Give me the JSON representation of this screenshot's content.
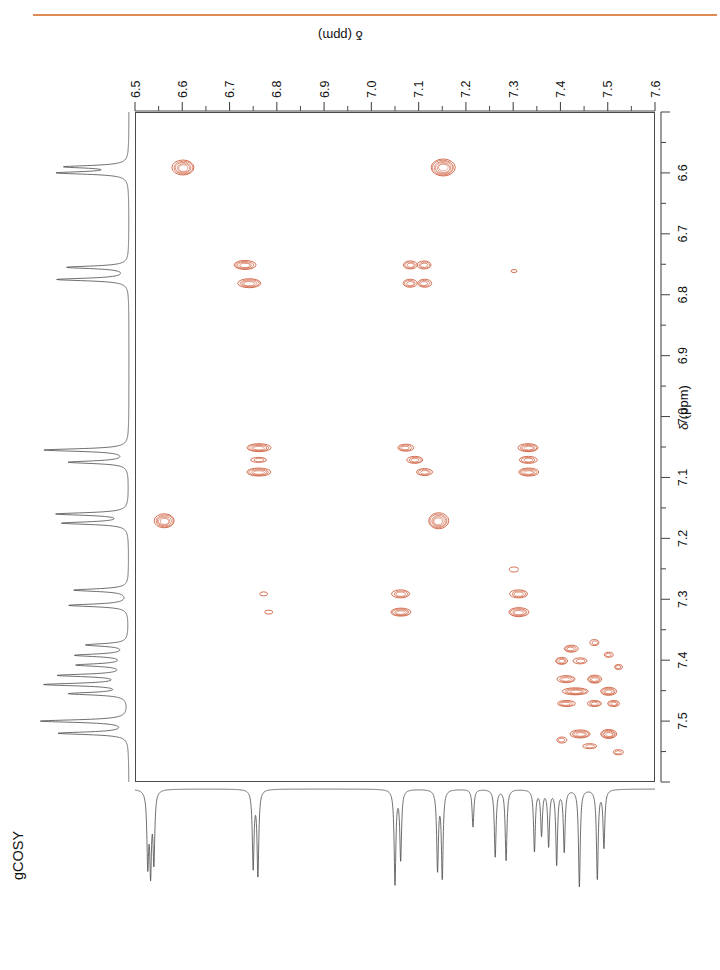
{
  "experiment": {
    "label": "gCOSY",
    "accent_color": "#E08B54",
    "contour_color": "#D2694A",
    "trace_color": "#4a4a4a"
  },
  "axes": {
    "top": {
      "title": "δ (ppm)",
      "ticks": [
        "6.5",
        "6.6",
        "6.7",
        "6.8",
        "6.9",
        "7.0",
        "7.1",
        "7.2",
        "7.3",
        "7.4",
        "7.5",
        "7.6"
      ],
      "min": 6.5,
      "max": 7.6,
      "direction": "left-to-right"
    },
    "right": {
      "title": "δ (ppm)",
      "ticks": [
        "6.6",
        "6.7",
        "6.8",
        "6.9",
        "7.0",
        "7.1",
        "7.2",
        "7.3",
        "7.4",
        "7.5"
      ],
      "min": 6.5,
      "max": 7.6,
      "direction": "top-to-bottom"
    }
  },
  "chart_data": {
    "type": "scatter",
    "title": "gCOSY",
    "xlabel": "δ (ppm)",
    "ylabel": "δ (ppm)",
    "xlim": [
      6.5,
      7.6
    ],
    "ylim": [
      7.6,
      6.5
    ],
    "grid": false,
    "legend": "none",
    "cross_peaks": [
      {
        "x": 6.6,
        "y": 6.59,
        "w": 22,
        "h": 15,
        "levels": 5,
        "note": "diagonal"
      },
      {
        "x": 7.15,
        "y": 6.59,
        "w": 24,
        "h": 17,
        "levels": 6,
        "note": "cross"
      },
      {
        "x": 6.73,
        "y": 6.75,
        "w": 22,
        "h": 9,
        "levels": 4
      },
      {
        "x": 6.74,
        "y": 6.78,
        "w": 23,
        "h": 9,
        "levels": 4
      },
      {
        "x": 7.08,
        "y": 6.75,
        "w": 14,
        "h": 8,
        "levels": 3
      },
      {
        "x": 7.11,
        "y": 6.75,
        "w": 14,
        "h": 8,
        "levels": 3
      },
      {
        "x": 7.08,
        "y": 6.78,
        "w": 14,
        "h": 8,
        "levels": 3
      },
      {
        "x": 7.11,
        "y": 6.78,
        "w": 14,
        "h": 8,
        "levels": 3
      },
      {
        "x": 7.3,
        "y": 6.76,
        "w": 6,
        "h": 3,
        "levels": 1
      },
      {
        "x": 6.76,
        "y": 7.05,
        "w": 24,
        "h": 8,
        "levels": 4
      },
      {
        "x": 6.76,
        "y": 7.07,
        "w": 16,
        "h": 5,
        "levels": 2
      },
      {
        "x": 6.76,
        "y": 7.09,
        "w": 24,
        "h": 8,
        "levels": 4
      },
      {
        "x": 7.07,
        "y": 7.05,
        "w": 16,
        "h": 7,
        "levels": 3
      },
      {
        "x": 7.09,
        "y": 7.07,
        "w": 16,
        "h": 7,
        "levels": 3
      },
      {
        "x": 7.11,
        "y": 7.09,
        "w": 16,
        "h": 7,
        "levels": 3
      },
      {
        "x": 7.33,
        "y": 7.05,
        "w": 20,
        "h": 8,
        "levels": 4
      },
      {
        "x": 7.33,
        "y": 7.07,
        "w": 18,
        "h": 7,
        "levels": 3
      },
      {
        "x": 7.33,
        "y": 7.09,
        "w": 20,
        "h": 8,
        "levels": 4
      },
      {
        "x": 6.56,
        "y": 7.17,
        "w": 20,
        "h": 14,
        "levels": 5,
        "note": "diagonal"
      },
      {
        "x": 7.14,
        "y": 7.17,
        "w": 20,
        "h": 16,
        "levels": 5
      },
      {
        "x": 7.3,
        "y": 7.25,
        "w": 9,
        "h": 5,
        "levels": 1
      },
      {
        "x": 6.77,
        "y": 7.29,
        "w": 8,
        "h": 4,
        "levels": 1
      },
      {
        "x": 6.78,
        "y": 7.32,
        "w": 8,
        "h": 4,
        "levels": 1
      },
      {
        "x": 7.06,
        "y": 7.29,
        "w": 18,
        "h": 8,
        "levels": 3
      },
      {
        "x": 7.06,
        "y": 7.32,
        "w": 20,
        "h": 8,
        "levels": 4
      },
      {
        "x": 7.31,
        "y": 7.29,
        "w": 18,
        "h": 8,
        "levels": 3
      },
      {
        "x": 7.31,
        "y": 7.32,
        "w": 20,
        "h": 9,
        "levels": 4
      },
      {
        "x": 7.42,
        "y": 7.38,
        "w": 14,
        "h": 7,
        "levels": 3
      },
      {
        "x": 7.47,
        "y": 7.37,
        "w": 9,
        "h": 6,
        "levels": 2
      },
      {
        "x": 7.4,
        "y": 7.4,
        "w": 12,
        "h": 7,
        "levels": 3
      },
      {
        "x": 7.44,
        "y": 7.4,
        "w": 14,
        "h": 6,
        "levels": 2
      },
      {
        "x": 7.5,
        "y": 7.39,
        "w": 9,
        "h": 5,
        "levels": 2
      },
      {
        "x": 7.52,
        "y": 7.41,
        "w": 8,
        "h": 5,
        "levels": 2
      },
      {
        "x": 7.41,
        "y": 7.43,
        "w": 18,
        "h": 7,
        "levels": 3
      },
      {
        "x": 7.47,
        "y": 7.43,
        "w": 14,
        "h": 8,
        "levels": 4
      },
      {
        "x": 7.43,
        "y": 7.45,
        "w": 26,
        "h": 7,
        "levels": 4
      },
      {
        "x": 7.5,
        "y": 7.45,
        "w": 16,
        "h": 8,
        "levels": 4
      },
      {
        "x": 7.41,
        "y": 7.47,
        "w": 18,
        "h": 6,
        "levels": 3
      },
      {
        "x": 7.47,
        "y": 7.47,
        "w": 14,
        "h": 6,
        "levels": 3
      },
      {
        "x": 7.51,
        "y": 7.47,
        "w": 12,
        "h": 6,
        "levels": 3
      },
      {
        "x": 7.44,
        "y": 7.52,
        "w": 20,
        "h": 8,
        "levels": 4
      },
      {
        "x": 7.5,
        "y": 7.52,
        "w": 16,
        "h": 9,
        "levels": 5
      },
      {
        "x": 7.4,
        "y": 7.53,
        "w": 10,
        "h": 6,
        "levels": 2
      },
      {
        "x": 7.46,
        "y": 7.54,
        "w": 14,
        "h": 5,
        "levels": 2
      },
      {
        "x": 7.52,
        "y": 7.55,
        "w": 10,
        "h": 5,
        "levels": 2
      }
    ],
    "f2_projection_peaks": [
      {
        "ppm": 6.527,
        "intensity": 0.72
      },
      {
        "ppm": 6.533,
        "intensity": 0.78
      },
      {
        "ppm": 6.54,
        "intensity": 0.7
      },
      {
        "ppm": 6.75,
        "intensity": 0.78
      },
      {
        "ppm": 6.76,
        "intensity": 0.86
      },
      {
        "ppm": 7.05,
        "intensity": 0.95
      },
      {
        "ppm": 7.062,
        "intensity": 0.7
      },
      {
        "ppm": 7.14,
        "intensity": 0.8
      },
      {
        "ppm": 7.15,
        "intensity": 0.88
      },
      {
        "ppm": 7.215,
        "intensity": 0.38
      },
      {
        "ppm": 7.262,
        "intensity": 0.68
      },
      {
        "ppm": 7.285,
        "intensity": 0.72
      },
      {
        "ppm": 7.345,
        "intensity": 0.62
      },
      {
        "ppm": 7.36,
        "intensity": 0.45
      },
      {
        "ppm": 7.375,
        "intensity": 0.56
      },
      {
        "ppm": 7.392,
        "intensity": 0.75
      },
      {
        "ppm": 7.408,
        "intensity": 0.62
      },
      {
        "ppm": 7.44,
        "intensity": 0.98
      },
      {
        "ppm": 7.478,
        "intensity": 0.9
      },
      {
        "ppm": 7.492,
        "intensity": 0.58
      }
    ],
    "f1_projection_peaks": [
      {
        "ppm": 6.59,
        "intensity": 0.62
      },
      {
        "ppm": 6.6,
        "intensity": 0.7
      },
      {
        "ppm": 6.755,
        "intensity": 0.62
      },
      {
        "ppm": 6.775,
        "intensity": 0.72
      },
      {
        "ppm": 7.055,
        "intensity": 0.85
      },
      {
        "ppm": 7.075,
        "intensity": 0.6
      },
      {
        "ppm": 7.16,
        "intensity": 0.72
      },
      {
        "ppm": 7.175,
        "intensity": 0.66
      },
      {
        "ppm": 7.285,
        "intensity": 0.55
      },
      {
        "ppm": 7.31,
        "intensity": 0.6
      },
      {
        "ppm": 7.375,
        "intensity": 0.42
      },
      {
        "ppm": 7.392,
        "intensity": 0.52
      },
      {
        "ppm": 7.408,
        "intensity": 0.5
      },
      {
        "ppm": 7.425,
        "intensity": 0.68
      },
      {
        "ppm": 7.44,
        "intensity": 0.82
      },
      {
        "ppm": 7.455,
        "intensity": 0.58
      },
      {
        "ppm": 7.5,
        "intensity": 0.88
      },
      {
        "ppm": 7.52,
        "intensity": 0.7
      }
    ]
  }
}
